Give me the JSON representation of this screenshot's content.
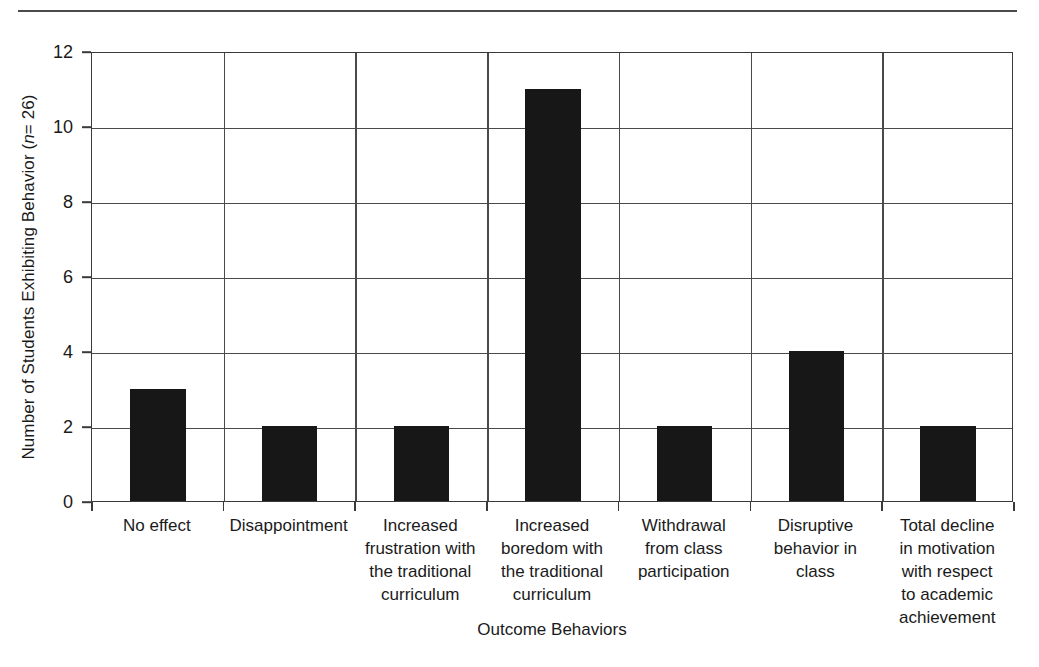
{
  "figure": {
    "top_rule": "horizontal-rule"
  },
  "chart_data": {
    "type": "bar",
    "title": "",
    "xlabel": "Outcome Behaviors",
    "ylabel": "Number of Students Exhibiting Behavior (n = 26)",
    "ylabel_prefix": "Number of Students Exhibiting Behavior (",
    "ylabel_italic": "n",
    "ylabel_suffix": " = 26)",
    "categories": [
      "No effect",
      "Disappointment",
      "Increased\nfrustration with\nthe traditional\ncurriculum",
      "Increased\nboredom with\nthe traditional\ncurriculum",
      "Withdrawal\nfrom class\nparticipation",
      "Disruptive\nbehavior in\nclass",
      "Total decline\nin motivation\nwith respect\nto academic\nachievement"
    ],
    "values": [
      3,
      2,
      2,
      11,
      2,
      4,
      2
    ],
    "ylim": [
      0,
      12
    ],
    "yticks": [
      0,
      2,
      4,
      6,
      8,
      10,
      12
    ],
    "ytick_labels": [
      "0",
      "2",
      "4",
      "6",
      "8",
      "10",
      "12"
    ],
    "grid": "horizontal-and-vertical",
    "legend": "none",
    "bar_color": "#171717",
    "axis_color": "#3a3a3a",
    "grid_color": "#4a4a4a",
    "background_color": "#ffffff",
    "n": 26
  }
}
